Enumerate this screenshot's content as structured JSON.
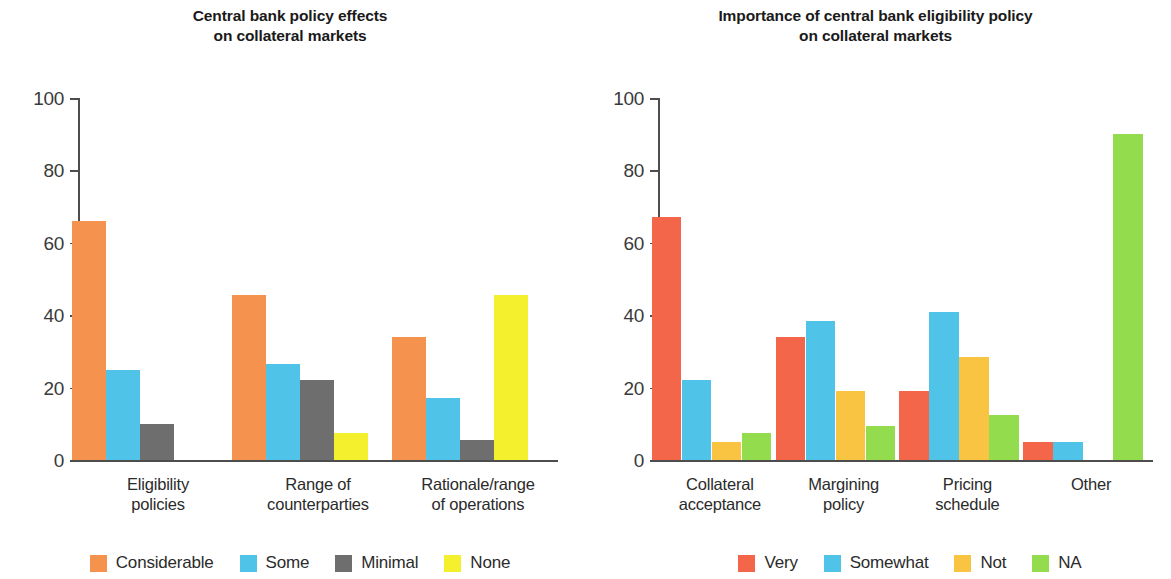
{
  "chart_data": [
    {
      "type": "bar",
      "panel": "left",
      "title": "Central bank policy effects on collateral markets",
      "title_lines": [
        "Central bank policy effects",
        "on collateral markets"
      ],
      "xlabel": "",
      "ylabel": "",
      "ylim": [
        0,
        100
      ],
      "yticks": [
        0,
        20,
        40,
        60,
        80,
        100
      ],
      "ytick_labels": [
        "0",
        "20",
        "40",
        "60",
        "80",
        "100"
      ],
      "grid": false,
      "legend_position": "bottom",
      "categories": [
        "Eligibility policies",
        "Range of counterparties",
        "Rationale/range of operations"
      ],
      "category_lines": [
        [
          "Eligibility",
          "policies"
        ],
        [
          "Range of",
          "counterparties"
        ],
        [
          "Rationale/range",
          "of operations"
        ]
      ],
      "series": [
        {
          "name": "Considerable",
          "color": "#F5934E",
          "values": [
            66,
            45.5,
            34
          ]
        },
        {
          "name": "Some",
          "color": "#4FC3E8",
          "values": [
            25,
            26.5,
            17
          ]
        },
        {
          "name": "Minimal",
          "color": "#6E6E6E",
          "values": [
            10,
            22,
            5.5
          ]
        },
        {
          "name": "None",
          "color": "#F5F02E",
          "values": [
            0,
            7.5,
            45.5
          ]
        }
      ]
    },
    {
      "type": "bar",
      "panel": "right",
      "title": "Importance of central bank eligibility policy on collateral markets",
      "title_lines": [
        "Importance of central bank eligibility policy",
        "on collateral markets"
      ],
      "xlabel": "",
      "ylabel": "",
      "ylim": [
        0,
        100
      ],
      "yticks": [
        0,
        20,
        40,
        60,
        80,
        100
      ],
      "ytick_labels": [
        "0",
        "20",
        "40",
        "60",
        "80",
        "100"
      ],
      "grid": false,
      "legend_position": "bottom",
      "categories": [
        "Collateral acceptance",
        "Margining policy",
        "Pricing schedule",
        "Other"
      ],
      "category_lines": [
        [
          "Collateral",
          "acceptance"
        ],
        [
          "Margining",
          "policy"
        ],
        [
          "Pricing",
          "schedule"
        ],
        [
          "Other",
          ""
        ]
      ],
      "series": [
        {
          "name": "Very",
          "color": "#F4664A",
          "values": [
            67,
            34,
            19,
            5
          ]
        },
        {
          "name": "Somewhat",
          "color": "#4FC3E8",
          "values": [
            22,
            38.5,
            41,
            5
          ]
        },
        {
          "name": "Not",
          "color": "#F9C441",
          "values": [
            5,
            19,
            28.5,
            0
          ]
        },
        {
          "name": "NA",
          "color": "#92DC4E",
          "values": [
            7.5,
            9.5,
            12.5,
            90
          ]
        }
      ]
    }
  ]
}
